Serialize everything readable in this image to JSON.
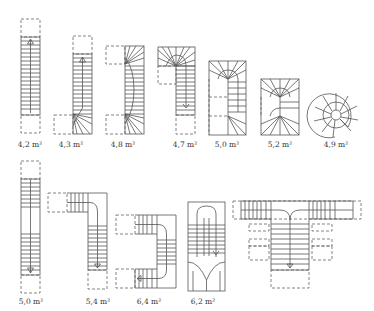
{
  "diagram": {
    "row1": [
      {
        "id": "straight",
        "label": "4,2 m²",
        "x": 30
      },
      {
        "id": "quarter-turn-bottom",
        "label": "4,3 m²",
        "x": 68
      },
      {
        "id": "double-quarter-turn",
        "label": "4,8 m²",
        "x": 120
      },
      {
        "id": "quarter-turn-top",
        "label": "4,7 m²",
        "x": 184
      },
      {
        "id": "half-turn",
        "label": "5,0 m²",
        "x": 224
      },
      {
        "id": "half-turn-winders",
        "label": "5,2 m²",
        "x": 276
      },
      {
        "id": "spiral",
        "label": "4,9 m²",
        "x": 329
      }
    ],
    "row2": [
      {
        "id": "straight-with-landing",
        "label": "5,0 m²",
        "x": 30
      },
      {
        "id": "L-landing",
        "label": "5,4 m²",
        "x": 98
      },
      {
        "id": "U-landing",
        "label": "6,4 m²",
        "x": 149
      },
      {
        "id": "curved-double",
        "label": "6,2 m²",
        "x": 202
      },
      {
        "id": "T-imperial",
        "label": "",
        "x": 0
      }
    ]
  }
}
